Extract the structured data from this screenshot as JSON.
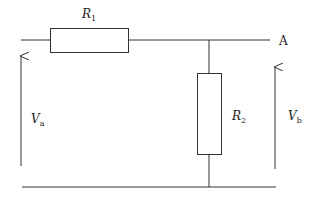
{
  "diagram": {
    "type": "circuit-voltage-divider",
    "stroke_color": "#333333",
    "background": "#ffffff",
    "components": {
      "r1": {
        "symbol": "R",
        "subscript": "1"
      },
      "r2": {
        "symbol": "R",
        "subscript": "2"
      }
    },
    "nodes": {
      "a": {
        "label": "A"
      }
    },
    "voltages": {
      "va": {
        "symbol": "V",
        "subscript": "a"
      },
      "vb": {
        "symbol": "V",
        "subscript": "b"
      }
    }
  }
}
